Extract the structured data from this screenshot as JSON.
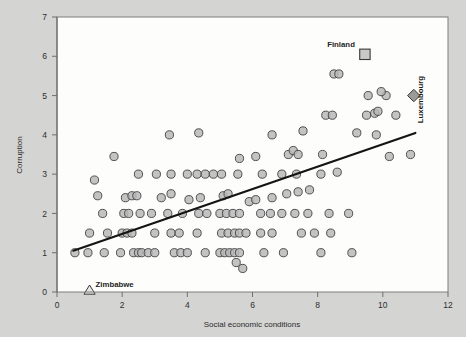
{
  "chart_data": {
    "type": "scatter",
    "title": "",
    "xlabel": "Social economic conditions",
    "ylabel": "Corruption",
    "xlim": [
      0,
      12
    ],
    "ylim": [
      0,
      7
    ],
    "xticks": [
      0,
      2,
      4,
      6,
      8,
      10,
      12
    ],
    "yticks": [
      0,
      1,
      2,
      3,
      4,
      5,
      6,
      7
    ],
    "grid": false,
    "legend": "none",
    "series": [
      {
        "name": "countries",
        "marker": "circle",
        "points": [
          [
            0.55,
            1.0
          ],
          [
            0.95,
            1.0
          ],
          [
            1.45,
            1.0
          ],
          [
            1.95,
            1.0
          ],
          [
            2.35,
            1.0
          ],
          [
            2.5,
            1.0
          ],
          [
            2.6,
            1.0
          ],
          [
            2.8,
            1.0
          ],
          [
            3.0,
            1.0
          ],
          [
            3.6,
            1.0
          ],
          [
            3.8,
            1.0
          ],
          [
            4.0,
            1.0
          ],
          [
            4.55,
            1.0
          ],
          [
            5.0,
            1.0
          ],
          [
            5.15,
            1.0
          ],
          [
            5.3,
            1.0
          ],
          [
            5.45,
            1.0
          ],
          [
            5.6,
            1.0
          ],
          [
            6.35,
            1.0
          ],
          [
            6.95,
            1.0
          ],
          [
            8.1,
            1.0
          ],
          [
            9.05,
            1.0
          ],
          [
            1.0,
            1.5
          ],
          [
            1.55,
            1.5
          ],
          [
            2.0,
            1.5
          ],
          [
            2.15,
            1.5
          ],
          [
            2.3,
            1.5
          ],
          [
            3.0,
            1.5
          ],
          [
            3.5,
            1.5
          ],
          [
            3.75,
            1.5
          ],
          [
            4.3,
            1.5
          ],
          [
            5.05,
            1.5
          ],
          [
            5.25,
            1.5
          ],
          [
            5.45,
            1.5
          ],
          [
            5.6,
            1.5
          ],
          [
            5.8,
            1.5
          ],
          [
            6.25,
            1.5
          ],
          [
            6.6,
            1.5
          ],
          [
            7.5,
            1.5
          ],
          [
            7.9,
            1.5
          ],
          [
            8.4,
            1.5
          ],
          [
            5.5,
            0.75
          ],
          [
            5.7,
            0.6
          ],
          [
            1.4,
            2.0
          ],
          [
            2.05,
            2.0
          ],
          [
            2.2,
            2.0
          ],
          [
            2.55,
            2.0
          ],
          [
            2.9,
            2.0
          ],
          [
            3.4,
            2.0
          ],
          [
            3.85,
            2.0
          ],
          [
            4.35,
            2.0
          ],
          [
            4.6,
            2.0
          ],
          [
            5.0,
            2.0
          ],
          [
            5.2,
            2.0
          ],
          [
            5.4,
            2.0
          ],
          [
            5.6,
            2.0
          ],
          [
            6.25,
            2.0
          ],
          [
            6.55,
            2.0
          ],
          [
            6.9,
            2.0
          ],
          [
            7.3,
            2.0
          ],
          [
            7.7,
            2.0
          ],
          [
            8.35,
            2.0
          ],
          [
            8.95,
            2.0
          ],
          [
            1.25,
            2.45
          ],
          [
            2.1,
            2.4
          ],
          [
            2.3,
            2.45
          ],
          [
            2.45,
            2.45
          ],
          [
            3.2,
            2.4
          ],
          [
            3.5,
            2.5
          ],
          [
            4.05,
            2.35
          ],
          [
            4.4,
            2.4
          ],
          [
            5.1,
            2.45
          ],
          [
            5.25,
            2.5
          ],
          [
            5.9,
            2.3
          ],
          [
            6.1,
            2.35
          ],
          [
            6.6,
            2.4
          ],
          [
            7.05,
            2.5
          ],
          [
            7.4,
            2.55
          ],
          [
            7.75,
            2.6
          ],
          [
            1.15,
            2.85
          ],
          [
            2.5,
            3.0
          ],
          [
            3.05,
            3.0
          ],
          [
            3.5,
            3.0
          ],
          [
            4.0,
            3.0
          ],
          [
            4.3,
            3.0
          ],
          [
            4.55,
            3.0
          ],
          [
            4.8,
            3.0
          ],
          [
            5.05,
            3.0
          ],
          [
            5.55,
            3.0
          ],
          [
            6.3,
            3.0
          ],
          [
            6.9,
            3.0
          ],
          [
            7.35,
            3.0
          ],
          [
            8.1,
            3.0
          ],
          [
            8.6,
            3.05
          ],
          [
            1.75,
            3.45
          ],
          [
            5.6,
            3.4
          ],
          [
            6.1,
            3.45
          ],
          [
            7.1,
            3.5
          ],
          [
            7.25,
            3.6
          ],
          [
            7.4,
            3.5
          ],
          [
            8.15,
            3.5
          ],
          [
            3.45,
            4.0
          ],
          [
            4.35,
            4.05
          ],
          [
            6.6,
            4.0
          ],
          [
            7.55,
            4.1
          ],
          [
            9.2,
            4.05
          ],
          [
            9.8,
            4.0
          ],
          [
            10.2,
            3.45
          ],
          [
            10.85,
            3.5
          ],
          [
            8.25,
            4.5
          ],
          [
            8.45,
            4.5
          ],
          [
            9.5,
            4.5
          ],
          [
            9.75,
            4.55
          ],
          [
            9.85,
            4.6
          ],
          [
            10.4,
            4.5
          ],
          [
            9.55,
            5.0
          ],
          [
            10.1,
            5.0
          ],
          [
            9.95,
            5.1
          ],
          [
            8.5,
            5.55
          ],
          [
            8.65,
            5.55
          ]
        ]
      }
    ],
    "highlights": [
      {
        "label": "Finland",
        "marker": "square",
        "x": 9.45,
        "y": 6.05,
        "label_side": "left"
      },
      {
        "label": "Luxembourg",
        "marker": "diamond",
        "x": 10.95,
        "y": 5.0,
        "label_side": "rotated"
      },
      {
        "label": "Zimbabwe",
        "marker": "triangle",
        "x": 1.0,
        "y": 0.0,
        "label_side": "right"
      }
    ],
    "trendline": {
      "x0": 0.5,
      "y0": 1.05,
      "x1": 11.0,
      "y1": 4.05
    }
  },
  "colors": {
    "background": "#d4d4d2",
    "plot_area": "#fdfdfb",
    "marker_fill": "#b8b8b8",
    "marker_stroke": "#404040",
    "trendline": "#141414",
    "frame": "#7d7d7d"
  }
}
